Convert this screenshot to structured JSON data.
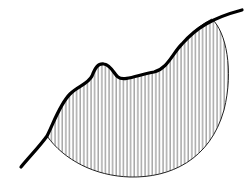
{
  "diagram": {
    "colors": {
      "background": "#ffffff",
      "curve": "#000000",
      "hatch": "#555555",
      "arc": "#222222"
    },
    "curve_path": "M21,167 C30,156 40,146 47,136 C54,122 60,104 70,94 C78,86 88,84 92,76 C95,68 98,63 104,64 C111,65 114,74 118,77 C124,82 140,74 154,72 C168,68 172,54 182,44 C196,28 212,18 242,10",
    "region_path": "M47,136 C54,122 60,104 70,94 C78,86 88,84 92,76 C95,68 98,63 104,64 C111,65 114,74 118,77 C124,82 140,74 154,72 C168,68 172,54 182,44 C192,32 202,24 212,19 C226,32 234,70 224,110 C210,160 170,178 130,177 C95,176 64,160 47,136 Z",
    "hatch_spacing": 3.6
  }
}
